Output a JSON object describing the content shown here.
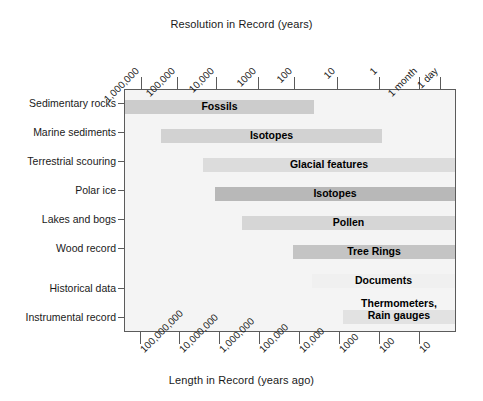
{
  "chart_data": {
    "type": "bar",
    "orientation": "horizontal",
    "title": "",
    "xlabel": "Length in Record (years ago)",
    "ylabel": "",
    "top_axis_label": "Resolution in Record (years)",
    "bottom_axis_label": "Length in Record (years ago)",
    "grid": false,
    "legend": "none",
    "top_axis": {
      "label": "Resolution in Record (years)",
      "scale": "log-descending",
      "ticks": [
        {
          "label": "1,000,000",
          "x": 140.5
        },
        {
          "label": "100,000",
          "x": 176.5
        },
        {
          "label": "10,000",
          "x": 216.0
        },
        {
          "label": "1000",
          "x": 257.5
        },
        {
          "label": "100",
          "x": 293.5
        },
        {
          "label": "10",
          "x": 336.5
        },
        {
          "label": "1",
          "x": 378.5
        },
        {
          "label": "1 month",
          "x": 418.5
        },
        {
          "label": "1 day",
          "x": 439.5
        }
      ]
    },
    "bottom_axis": {
      "label": "Length in Record (years ago)",
      "scale": "log-descending",
      "ticks": [
        {
          "label": "100,000,000",
          "x": 139.5
        },
        {
          "label": "10,000,000",
          "x": 178.5
        },
        {
          "label": "1,000,000",
          "x": 219.0
        },
        {
          "label": "100,000",
          "x": 258.5
        },
        {
          "label": "10,000",
          "x": 298.5
        },
        {
          "label": "1000",
          "x": 338.5
        },
        {
          "label": "100",
          "x": 378.5
        },
        {
          "label": "10",
          "x": 418.5
        }
      ]
    },
    "categories": [
      "Sedimentary rocks",
      "Marine sediments",
      "Terrestrial scouring",
      "Polar ice",
      "Lakes and bogs",
      "Wood record",
      "Historical data",
      "Instrumental record"
    ],
    "bars": [
      {
        "category": "Sedimentary rocks",
        "label": "Fossils",
        "label_line2": "",
        "x_start": 125,
        "x_end": 314,
        "y": 100,
        "color": "#cccccc"
      },
      {
        "category": "Marine sediments",
        "label": "Isotopes",
        "label_line2": "",
        "x_start": 161,
        "x_end": 382,
        "y": 129,
        "color": "#d2d2d2"
      },
      {
        "category": "Terrestrial scouring",
        "label": "Glacial features",
        "label_line2": "",
        "x_start": 203,
        "x_end": 455,
        "y": 158,
        "color": "#dcdcdc"
      },
      {
        "category": "Polar ice",
        "label": "Isotopes",
        "label_line2": "",
        "x_start": 215,
        "x_end": 455,
        "y": 187,
        "color": "#b8b8b8"
      },
      {
        "category": "Lakes and bogs",
        "label": "Pollen",
        "label_line2": "",
        "x_start": 242,
        "x_end": 455,
        "y": 216,
        "color": "#d6d6d6"
      },
      {
        "category": "Wood record",
        "label": "Tree Rings",
        "label_line2": "",
        "x_start": 293,
        "x_end": 455,
        "y": 245,
        "color": "#c4c4c4"
      },
      {
        "category": "Historical data",
        "label": "Documents",
        "label_line2": "",
        "x_start": 312,
        "x_end": 455,
        "y": 274,
        "color": "#f0f0f0"
      },
      {
        "category": "Instrumental record",
        "label": "Thermometers,",
        "label_line2": "Rain gauges",
        "x_start": 343,
        "x_end": 455,
        "y": 310,
        "color": "#e2e2e2"
      }
    ],
    "row_label_y": [
      103,
      132,
      161,
      190,
      219,
      248,
      288,
      317
    ],
    "colors": {
      "frame": "#5b5b5b",
      "plot_background": "#f4f4f4",
      "text": "#1a1a1a",
      "bar_label": "#000000"
    }
  }
}
